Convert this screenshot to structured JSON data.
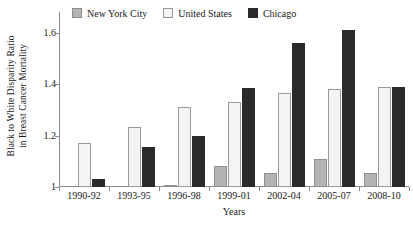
{
  "chart_data": {
    "type": "bar",
    "title": "",
    "subtitle": "",
    "xlabel": "Years",
    "ylabel_line1": "Black to White Disparity Ratio",
    "ylabel_line2": "in Breast Cancer Mortality",
    "categories": [
      "1990-92",
      "1993-95",
      "1996-98",
      "1999-01",
      "2002-04",
      "2005-07",
      "2008-10"
    ],
    "series": [
      {
        "name": "New York City",
        "color": "#b4b4b4",
        "values": [
          1.0,
          1.0,
          1.005,
          1.08,
          1.055,
          1.11,
          1.055
        ]
      },
      {
        "name": "United States",
        "color": "#f4f4f2",
        "values": [
          1.17,
          1.235,
          1.31,
          1.33,
          1.365,
          1.38,
          1.39
        ]
      },
      {
        "name": "Chicago",
        "color": "#2a2a2a",
        "values": [
          1.03,
          1.155,
          1.2,
          1.385,
          1.56,
          1.61,
          1.39
        ]
      }
    ],
    "ylim": [
      1.0,
      1.68
    ],
    "yticks": [
      1,
      1.2,
      1.4,
      1.6
    ],
    "ytick_labels": [
      "1",
      "1.2",
      "1.4",
      "1.6"
    ],
    "grid": false,
    "legend_position": "top-center",
    "legend": [
      "New York City",
      "United States",
      "Chicago"
    ]
  }
}
